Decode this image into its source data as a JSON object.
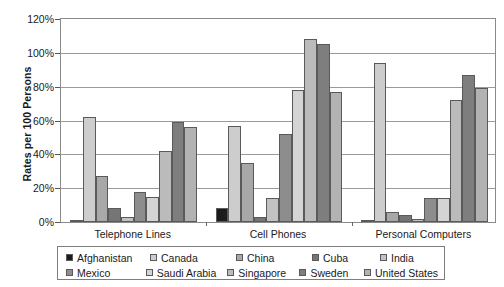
{
  "chart_data": {
    "type": "bar",
    "title": "",
    "subtitle": "",
    "xlabel": "",
    "ylabel": "Rates per 100 Persons",
    "ylim": [
      0,
      120
    ],
    "ytick_values": [
      0,
      20,
      40,
      60,
      80,
      100,
      120
    ],
    "ytick_labels": [
      "0%",
      "20%",
      "40%",
      "60%",
      "80%",
      "100%",
      "120%"
    ],
    "grid": true,
    "legend_position": "bottom",
    "categories": [
      "Telephone Lines",
      "Cell Phones",
      "Personal Computers"
    ],
    "series": [
      {
        "name": "Afghanistan",
        "color": "#1c1c1c",
        "values": [
          1,
          8,
          0.5
        ]
      },
      {
        "name": "Canada",
        "color": "#cdcdcd",
        "values": [
          62,
          57,
          94
        ]
      },
      {
        "name": "China",
        "color": "#a8a8a8",
        "values": [
          27,
          35,
          6
        ]
      },
      {
        "name": "Cuba",
        "color": "#757575",
        "values": [
          8,
          3,
          4
        ]
      },
      {
        "name": "India",
        "color": "#c2c2c2",
        "values": [
          3,
          14,
          2
        ]
      },
      {
        "name": "Mexico",
        "color": "#8d8d8d",
        "values": [
          18,
          52,
          14
        ]
      },
      {
        "name": "Saudi Arabia",
        "color": "#d4d4d4",
        "values": [
          15,
          78,
          14
        ]
      },
      {
        "name": "Singapore",
        "color": "#bbbbbb",
        "values": [
          42,
          108,
          72
        ]
      },
      {
        "name": "Sweden",
        "color": "#7e7e7e",
        "values": [
          59,
          105,
          87
        ]
      },
      {
        "name": "United States",
        "color": "#b2b2b2",
        "values": [
          56,
          77,
          79
        ]
      }
    ]
  },
  "legend": {
    "rows": [
      [
        "Afghanistan",
        "Canada",
        "China",
        "Cuba",
        "India"
      ],
      [
        "Mexico",
        "Saudi Arabia",
        "Singapore",
        "Sweden",
        "United States"
      ]
    ]
  }
}
